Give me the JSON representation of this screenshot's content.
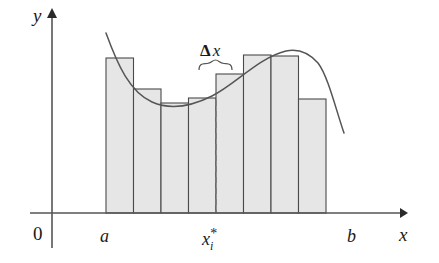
{
  "figure": {
    "colors": {
      "bar_fill": "#e6e6e6",
      "bar_stroke": "#4a4a4a",
      "curve_stroke": "#555555",
      "axis_stroke": "#555555",
      "dashed_stroke": "#7a7a7a",
      "text": "#1a1a1a",
      "background": "#ffffff"
    },
    "labels": {
      "y_axis": "y",
      "x_axis": "x",
      "origin": "0",
      "left_endpoint": "a",
      "right_endpoint": "b",
      "sample_point_base": "x",
      "sample_point_sub": "i",
      "sample_point_star": "*",
      "delta_greek": "Δ",
      "delta_var": "x"
    }
  },
  "chart_data": {
    "type": "bar",
    "xlabel": "x",
    "ylabel": "y",
    "grid": false,
    "legend": null,
    "axis": {
      "x_axis_y_px": 213,
      "y_axis_x_px": 52,
      "x_arrow_tip_px": 407,
      "y_arrow_tip_px": 10
    },
    "categories": [
      "1",
      "2",
      "3",
      "4",
      "5",
      "6",
      "7",
      "8"
    ],
    "bar_edges_px": [
      106,
      133.5,
      161,
      188.5,
      216,
      243.5,
      271,
      298.5,
      326
    ],
    "bar_tops_px": [
      58,
      89,
      103,
      98,
      74,
      55,
      56,
      99
    ],
    "values": [
      155,
      124,
      110,
      115,
      139,
      158,
      157,
      114
    ],
    "baseline_px": 213,
    "curve_points_px": [
      [
        106,
        33
      ],
      [
        112,
        48
      ],
      [
        118,
        62
      ],
      [
        125,
        76
      ],
      [
        133,
        87
      ],
      [
        142,
        96
      ],
      [
        152,
        102
      ],
      [
        163,
        105
      ],
      [
        174,
        106
      ],
      [
        185,
        105
      ],
      [
        196,
        103
      ],
      [
        206,
        99
      ],
      [
        216,
        93
      ],
      [
        226,
        86
      ],
      [
        236,
        78
      ],
      [
        246,
        70
      ],
      [
        256,
        63
      ],
      [
        266,
        57
      ],
      [
        276,
        53
      ],
      [
        286,
        51
      ],
      [
        296,
        50
      ],
      [
        306,
        52
      ],
      [
        314,
        57
      ],
      [
        321,
        65
      ],
      [
        328,
        78
      ],
      [
        334,
        95
      ],
      [
        340,
        115
      ],
      [
        344,
        133
      ]
    ],
    "sample_point_px": 216,
    "delta_brace": {
      "x_start_px": 199,
      "x_end_px": 231,
      "y_px": 63
    },
    "delta_label_px": {
      "x": 200,
      "y": 56
    },
    "annotations": [
      {
        "text": "Δx",
        "kind": "interval-width"
      },
      {
        "text": "x*_i",
        "kind": "sample-point"
      },
      {
        "text": "a",
        "kind": "left-endpoint"
      },
      {
        "text": "b",
        "kind": "right-endpoint"
      },
      {
        "text": "0",
        "kind": "origin"
      }
    ]
  }
}
